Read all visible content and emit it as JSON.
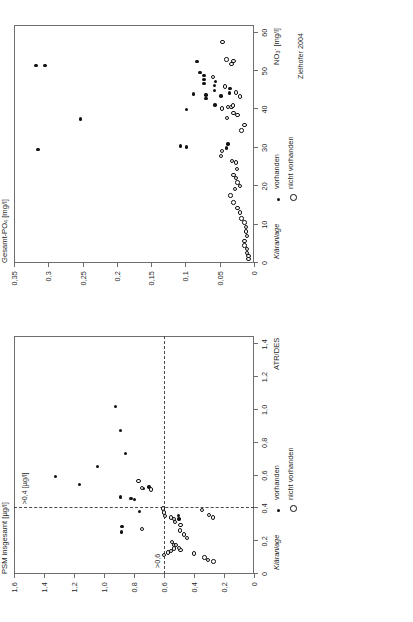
{
  "figure": {
    "credit": "Zielhofer 2004",
    "legend": {
      "title": "Kläranlage",
      "items": [
        {
          "label": "vorhanden",
          "marker": "filled-circle"
        },
        {
          "label": "nicht vorhanden",
          "marker": "open-circle"
        }
      ]
    }
  },
  "chart_data": [
    {
      "id": "phosphate-nitrate",
      "type": "scatter",
      "title": "",
      "xlabel": "NO₃⁻ [mg/l]",
      "ylabel": "Gesamt-PO₄ [mg/l]",
      "xlim": [
        0,
        62
      ],
      "ylim": [
        0,
        0.35
      ],
      "xticks": [
        0,
        10,
        20,
        30,
        40,
        50,
        60
      ],
      "xticklabels": [
        "0",
        "10",
        "20",
        "30",
        "40",
        "50",
        "60"
      ],
      "yticks": [
        0,
        0.05,
        0.1,
        0.15,
        0.2,
        0.25,
        0.3,
        0.35
      ],
      "yticklabels": [
        "0",
        "0,05",
        "0,1",
        "0,15",
        "0,2",
        "0,25",
        "0,3",
        "0,35"
      ],
      "grid": false,
      "legend_position": "below-right",
      "series": [
        {
          "name": "vorhanden",
          "marker": "filled-circle",
          "points": [
            [
              51.5,
              0.318
            ],
            [
              51.5,
              0.305
            ],
            [
              29.5,
              0.315
            ],
            [
              37.5,
              0.253
            ],
            [
              52.5,
              0.083
            ],
            [
              40.0,
              0.098
            ],
            [
              44.0,
              0.088
            ],
            [
              30.5,
              0.107
            ],
            [
              30.2,
              0.098
            ],
            [
              46.8,
              0.073
            ],
            [
              47.8,
              0.073
            ],
            [
              48.9,
              0.073
            ],
            [
              49.6,
              0.079
            ],
            [
              42.8,
              0.07
            ],
            [
              43.8,
              0.07
            ],
            [
              45.0,
              0.058
            ],
            [
              46.2,
              0.058
            ],
            [
              47.3,
              0.056
            ],
            [
              43.5,
              0.048
            ],
            [
              41.2,
              0.057
            ],
            [
              30.0,
              0.04
            ],
            [
              31.0,
              0.038
            ],
            [
              44.3,
              0.036
            ],
            [
              45.4,
              0.035
            ]
          ]
        },
        {
          "name": "nicht vorhanden",
          "marker": "open-circle",
          "points": [
            [
              57.5,
              0.046
            ],
            [
              53.0,
              0.04
            ],
            [
              51.8,
              0.033
            ],
            [
              52.6,
              0.03
            ],
            [
              48.4,
              0.06
            ],
            [
              46.0,
              0.042
            ],
            [
              44.4,
              0.026
            ],
            [
              43.4,
              0.02
            ],
            [
              40.2,
              0.047
            ],
            [
              40.6,
              0.038
            ],
            [
              40.6,
              0.033
            ],
            [
              41.0,
              0.031
            ],
            [
              39.0,
              0.03
            ],
            [
              38.6,
              0.024
            ],
            [
              37.8,
              0.039
            ],
            [
              29.2,
              0.047
            ],
            [
              27.8,
              0.048
            ],
            [
              26.5,
              0.032
            ],
            [
              26.2,
              0.026
            ],
            [
              24.5,
              0.025
            ],
            [
              23.0,
              0.03
            ],
            [
              22.2,
              0.026
            ],
            [
              21.0,
              0.024
            ],
            [
              20.0,
              0.02
            ],
            [
              19.2,
              0.028
            ],
            [
              17.6,
              0.034
            ],
            [
              15.8,
              0.03
            ],
            [
              14.4,
              0.024
            ],
            [
              13.2,
              0.02
            ],
            [
              11.6,
              0.018
            ],
            [
              10.6,
              0.014
            ],
            [
              9.4,
              0.012
            ],
            [
              8.2,
              0.012
            ],
            [
              7.0,
              0.01
            ],
            [
              5.8,
              0.014
            ],
            [
              4.6,
              0.014
            ],
            [
              3.6,
              0.01
            ],
            [
              2.6,
              0.01
            ],
            [
              1.8,
              0.008
            ],
            [
              1.0,
              0.008
            ],
            [
              34.5,
              0.018
            ],
            [
              36.0,
              0.014
            ]
          ]
        }
      ]
    },
    {
      "id": "psm-atrdes",
      "type": "scatter",
      "title": "",
      "xlabel": "ATR/DES",
      "ylabel": "PSM insgesamt [µg/l]",
      "xlim": [
        0,
        1.45
      ],
      "ylim": [
        0,
        1.6
      ],
      "xticks": [
        0,
        0.2,
        0.4,
        0.6,
        0.8,
        1.0,
        1.2,
        1.4
      ],
      "xticklabels": [
        "0",
        "0,2",
        "0,4",
        "0,6",
        "0,8",
        "1,0",
        "1,2",
        "1,4"
      ],
      "yticks": [
        0,
        0.2,
        0.4,
        0.6,
        0.8,
        1.0,
        1.2,
        1.4,
        1.6
      ],
      "yticklabels": [
        "0",
        "0,2",
        "0,4",
        "0,6",
        "0,8",
        "1,0",
        "1,2",
        "1,4",
        "1,6"
      ],
      "grid": false,
      "legend_position": "below-right",
      "annotations": [
        {
          "text": ">0,6",
          "type": "hline-label",
          "value": 0.6
        },
        {
          "text": ">0,4 [µg/l]",
          "type": "vline-label",
          "value": 0.4
        }
      ],
      "reference_lines": [
        {
          "orientation": "horizontal",
          "value": 0.6,
          "style": "dashed"
        },
        {
          "orientation": "vertical",
          "value": 0.4,
          "style": "dashed"
        }
      ],
      "series": [
        {
          "name": "vorhanden",
          "marker": "filled-circle",
          "points": [
            [
              0.595,
              1.325
            ],
            [
              0.545,
              1.165
            ],
            [
              0.655,
              1.045
            ],
            [
              0.735,
              0.855
            ],
            [
              1.02,
              0.925
            ],
            [
              0.875,
              0.89
            ],
            [
              0.47,
              0.89
            ],
            [
              0.29,
              0.88
            ],
            [
              0.255,
              0.885
            ],
            [
              0.46,
              0.82
            ],
            [
              0.455,
              0.795
            ],
            [
              0.52,
              0.735
            ],
            [
              0.38,
              0.765
            ],
            [
              0.53,
              0.7
            ],
            [
              0.355,
              0.505
            ],
            [
              0.335,
              0.5
            ]
          ]
        },
        {
          "name": "nicht vorhanden",
          "marker": "open-circle",
          "points": [
            [
              0.565,
              0.77
            ],
            [
              0.525,
              0.745
            ],
            [
              0.515,
              0.685
            ],
            [
              0.275,
              0.745
            ],
            [
              0.4,
              0.605
            ],
            [
              0.375,
              0.6
            ],
            [
              0.355,
              0.595
            ],
            [
              0.345,
              0.555
            ],
            [
              0.335,
              0.535
            ],
            [
              0.315,
              0.525
            ],
            [
              0.3,
              0.49
            ],
            [
              0.265,
              0.495
            ],
            [
              0.24,
              0.465
            ],
            [
              0.22,
              0.445
            ],
            [
              0.195,
              0.545
            ],
            [
              0.175,
              0.535
            ],
            [
              0.155,
              0.535
            ],
            [
              0.14,
              0.555
            ],
            [
              0.13,
              0.575
            ],
            [
              0.115,
              0.6
            ],
            [
              0.145,
              0.49
            ],
            [
              0.16,
              0.5
            ],
            [
              0.125,
              0.4
            ],
            [
              0.1,
              0.33
            ],
            [
              0.085,
              0.305
            ],
            [
              0.075,
              0.27
            ],
            [
              0.39,
              0.345
            ],
            [
              0.36,
              0.3
            ],
            [
              0.345,
              0.275
            ],
            [
              0.175,
              0.52
            ]
          ]
        }
      ]
    }
  ]
}
